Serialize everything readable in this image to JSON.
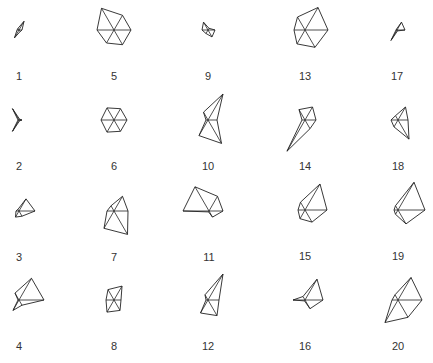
{
  "chart_data": {
    "type": "star",
    "title": "",
    "layout": {
      "columns": 5,
      "rows": 4,
      "order": "column-major"
    },
    "variables": 6,
    "spoke_angles_deg": [
      0,
      60,
      120,
      180,
      240,
      300
    ],
    "draw_segments": true,
    "colors": {
      "line": "#222222",
      "label": "#333333",
      "background": "#ffffff"
    },
    "stars": [
      {
        "label": "1",
        "cx": 19,
        "cy": 30,
        "radii": [
          3,
          10,
          2,
          2,
          9,
          2
        ]
      },
      {
        "label": "2",
        "cx": 19,
        "cy": 120,
        "radii": [
          3,
          1,
          13,
          1,
          13,
          1
        ]
      },
      {
        "label": "3",
        "cx": 19,
        "cy": 211,
        "radii": [
          16,
          14,
          2,
          3,
          7,
          6
        ]
      },
      {
        "label": "4",
        "cx": 19,
        "cy": 300,
        "radii": [
          25,
          25,
          8,
          1,
          12,
          6
        ]
      },
      {
        "label": "5",
        "cx": 114,
        "cy": 30,
        "radii": [
          17,
          17,
          25,
          17,
          15,
          17
        ]
      },
      {
        "label": "6",
        "cx": 114,
        "cy": 120,
        "radii": [
          13,
          13,
          14,
          13,
          14,
          13
        ]
      },
      {
        "label": "7",
        "cx": 114,
        "cy": 211,
        "radii": [
          14,
          17,
          6,
          7,
          20,
          27
        ]
      },
      {
        "label": "8",
        "cx": 114,
        "cy": 300,
        "radii": [
          7,
          16,
          12,
          8,
          14,
          12
        ]
      },
      {
        "label": "9",
        "cx": 208,
        "cy": 30,
        "radii": [
          7,
          2,
          9,
          6,
          4,
          8
        ]
      },
      {
        "label": "10",
        "cx": 208,
        "cy": 120,
        "radii": [
          9,
          30,
          9,
          2,
          18,
          27
        ]
      },
      {
        "label": "11",
        "cx": 209,
        "cy": 211,
        "radii": [
          14,
          17,
          28,
          26,
          1,
          7
        ]
      },
      {
        "label": "12",
        "cx": 208,
        "cy": 300,
        "radii": [
          11,
          30,
          6,
          2,
          15,
          18
        ]
      },
      {
        "label": "13",
        "cx": 305,
        "cy": 30,
        "radii": [
          23,
          26,
          15,
          11,
          16,
          20
        ]
      },
      {
        "label": "14",
        "cx": 305,
        "cy": 120,
        "radii": [
          11,
          15,
          12,
          3,
          36,
          10
        ]
      },
      {
        "label": "15",
        "cx": 305,
        "cy": 210,
        "radii": [
          22,
          30,
          9,
          7,
          10,
          14
        ]
      },
      {
        "label": "16",
        "cx": 305,
        "cy": 300,
        "radii": [
          18,
          24,
          4,
          12,
          1,
          10
        ]
      },
      {
        "label": "17",
        "cx": 397,
        "cy": 30,
        "radii": [
          8,
          9,
          1,
          1,
          12,
          1
        ]
      },
      {
        "label": "18",
        "cx": 398,
        "cy": 120,
        "radii": [
          10,
          15,
          5,
          7,
          8,
          22
        ]
      },
      {
        "label": "19",
        "cx": 398,
        "cy": 210,
        "radii": [
          27,
          32,
          5,
          4,
          5,
          16
        ]
      },
      {
        "label": "20",
        "cx": 398,
        "cy": 300,
        "radii": [
          24,
          26,
          6,
          6,
          26,
          20
        ]
      }
    ]
  }
}
